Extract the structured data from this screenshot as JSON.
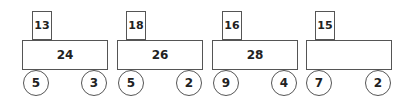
{
  "cars": [
    {
      "top": "13",
      "body": "24",
      "wheel_left": "5",
      "wheel_right": "3"
    },
    {
      "top": "18",
      "body": "26",
      "wheel_left": "5",
      "wheel_right": "2"
    },
    {
      "top": "16",
      "body": "28",
      "wheel_left": "9",
      "wheel_right": "4"
    },
    {
      "top": "15",
      "body": "",
      "wheel_left": "7",
      "wheel_right": "2"
    }
  ]
}
